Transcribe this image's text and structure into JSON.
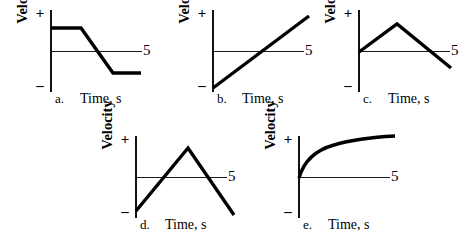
{
  "figure": {
    "axis_y_label": "Velocity",
    "axis_x_label": "Time, s",
    "positive_sign": "+",
    "negative_sign": "–",
    "axis_end_tick_label": "5",
    "curve_color": "#000000",
    "axis_color": "#111111",
    "background": "#ffffff"
  },
  "panels": [
    {
      "letter": "a.",
      "ylabel": "Velocity",
      "xlabel": "Time, s",
      "plus": "+",
      "minus": "–",
      "five": "5",
      "shape": "constant-positive-then-linear-decrease-then-constant-negative",
      "path": "M 41 26 L 71 26 L 103 71 L 131 71"
    },
    {
      "letter": "b.",
      "ylabel": "Velocity",
      "xlabel": "Time, s",
      "plus": "+",
      "minus": "–",
      "five": "5",
      "shape": "linear-increase-from-negative-to-positive",
      "path": "M 41 86 L 137 14"
    },
    {
      "letter": "c.",
      "ylabel": "Velocity",
      "xlabel": "Time, s",
      "plus": "+",
      "minus": "–",
      "five": "5",
      "shape": "rise-to-peak-then-linear-decrease-below-axis",
      "path": "M 41 50 L 79 22 L 133 66"
    },
    {
      "letter": "d.",
      "ylabel": "Velocity",
      "xlabel": "Time, s",
      "plus": "+",
      "minus": "–",
      "five": "5",
      "shape": "linear-rise-from-negative-to-peak-then-linear-decrease-to-negative",
      "path": "M 41 83 L 93 20 L 139 87"
    },
    {
      "letter": "e.",
      "ylabel": "Velocity",
      "xlabel": "Time, s",
      "plus": "+",
      "minus": "–",
      "five": "5",
      "shape": "concave-down-increasing-curve-from-origin",
      "path": "M 41 50 C 46 32 58 22 76 17 C 96 11 118 9 137 8"
    }
  ],
  "chart_data": {
    "type": "line",
    "title": "",
    "xlabel": "Time, s",
    "ylabel": "Velocity",
    "xlim": [
      0,
      5
    ],
    "ylim": [
      -1,
      1
    ],
    "grid": false,
    "legend_position": "none",
    "panel_count": 5,
    "series": [
      {
        "name": "a.",
        "description": "Constant positive velocity, then uniform decrease, then constant negative velocity",
        "x": [
          0,
          1.6,
          3.3,
          4.8
        ],
        "values": [
          0.55,
          0.55,
          -0.54,
          -0.54
        ]
      },
      {
        "name": "b.",
        "description": "Uniformly increasing velocity from negative through zero to positive",
        "x": [
          0,
          5
        ],
        "values": [
          -0.88,
          0.88
        ]
      },
      {
        "name": "c.",
        "description": "Velocity increases from zero to a peak, then uniformly decreases through zero to negative",
        "x": [
          0,
          2.0,
          4.8
        ],
        "values": [
          0.0,
          0.68,
          -0.39
        ]
      },
      {
        "name": "d.",
        "description": "Velocity increases uniformly from negative through zero to a peak, then decreases uniformly to negative",
        "x": [
          0,
          2.7,
          5.1
        ],
        "values": [
          -0.8,
          0.73,
          -0.9
        ]
      },
      {
        "name": "e.",
        "description": "Velocity increases from zero at a decreasing rate, levelling off (concave down)",
        "x": [
          0,
          0.5,
          1.0,
          1.8,
          2.9,
          4.0,
          5.0
        ],
        "values": [
          0.0,
          0.38,
          0.52,
          0.68,
          0.82,
          0.92,
          1.0
        ]
      }
    ]
  }
}
